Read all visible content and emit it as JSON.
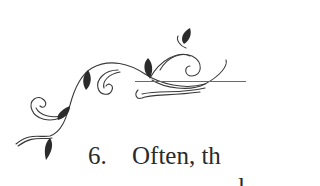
{
  "document": {
    "list_item": {
      "number": "6.",
      "text": "Often, th"
    },
    "next_line_fragment": "l"
  },
  "colors": {
    "ink": "#2a2a2a",
    "rule": "#6a6a6a",
    "background": "#ffffff"
  }
}
